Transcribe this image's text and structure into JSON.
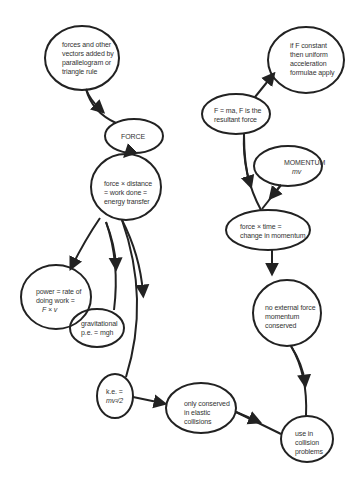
{
  "diagram": {
    "type": "concept-map",
    "colors": {
      "stroke": "#222222",
      "text": "#333333",
      "background": "#ffffff"
    },
    "nodes": {
      "vectors": {
        "lines": [
          "forces and other",
          "vectors added by",
          "parallelogram or",
          "triangle rule"
        ]
      },
      "force": {
        "lines": [
          "FORCE"
        ]
      },
      "work": {
        "lines": [
          "force × distance",
          "= work done =",
          "energy transfer"
        ]
      },
      "power": {
        "lines": [
          "power = rate of",
          "doing work =",
          "F × v"
        ]
      },
      "gpe": {
        "lines": [
          "gravitational",
          "p.e. = mgh"
        ]
      },
      "ke": {
        "lines": [
          "k.e. =",
          "mv²/2"
        ]
      },
      "elastic": {
        "lines": [
          "only conserved",
          "in elastic",
          "collisions"
        ]
      },
      "collision": {
        "lines": [
          "use in",
          "collision",
          "problems"
        ]
      },
      "fma": {
        "lines": [
          "F = ma, F is the",
          "resultant force"
        ]
      },
      "constant": {
        "lines": [
          "if F constant",
          "then uniform",
          "acceleration",
          "formulae apply"
        ]
      },
      "momentum": {
        "lines": [
          "MOMENTUM",
          "mv"
        ]
      },
      "impulse": {
        "lines": [
          "force × time =",
          "change in momentum"
        ]
      },
      "conserved": {
        "lines": [
          "no external force",
          "momentum",
          "conserved"
        ]
      }
    },
    "edges": [
      {
        "from": "vectors",
        "to": "force"
      },
      {
        "from": "force",
        "to": "work"
      },
      {
        "from": "work",
        "to": "power"
      },
      {
        "from": "work",
        "to": "gpe"
      },
      {
        "from": "work",
        "to": "ke"
      },
      {
        "from": "ke",
        "to": "elastic"
      },
      {
        "from": "elastic",
        "to": "collision"
      },
      {
        "from": "fma",
        "to": "constant"
      },
      {
        "from": "fma",
        "to": "impulse"
      },
      {
        "from": "momentum",
        "to": "impulse"
      },
      {
        "from": "impulse",
        "to": "conserved"
      },
      {
        "from": "conserved",
        "to": "collision"
      }
    ]
  }
}
